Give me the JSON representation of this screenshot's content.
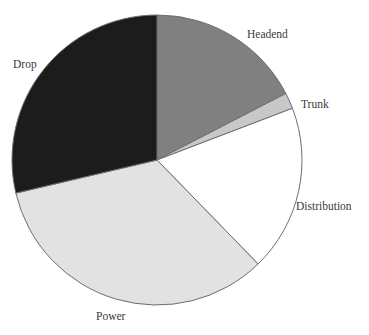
{
  "chart_data": {
    "type": "pie",
    "title": "",
    "subtitle": "",
    "xlabel": "",
    "ylabel": "",
    "legend_position": "none",
    "grid": false,
    "labels_outside": true,
    "start_angle_deg": 0,
    "direction": "clockwise",
    "categories": [
      "Headend",
      "Trunk",
      "Distribution",
      "Power",
      "Drop"
    ],
    "values": [
      17.4,
      1.8,
      18.5,
      33.6,
      28.7
    ],
    "units": "percent",
    "slices": [
      {
        "label": "Headend",
        "value": 17.4,
        "start_angle_deg": 0.0,
        "end_angle_deg": 62.7,
        "color": "#808080"
      },
      {
        "label": "Trunk",
        "value": 1.8,
        "start_angle_deg": 62.7,
        "end_angle_deg": 69.1,
        "color": "#c8c8c8"
      },
      {
        "label": "Distribution",
        "value": 18.5,
        "start_angle_deg": 69.1,
        "end_angle_deg": 135.8,
        "color": "#ffffff"
      },
      {
        "label": "Power",
        "value": 33.6,
        "start_angle_deg": 135.8,
        "end_angle_deg": 256.8,
        "color": "#e2e2e2"
      },
      {
        "label": "Drop",
        "value": 28.7,
        "start_angle_deg": 256.8,
        "end_angle_deg": 360.0,
        "color": "#1c1c1c"
      }
    ],
    "geometry": {
      "center_x": 157,
      "center_y": 160,
      "radius": 145
    },
    "style": {
      "outline_color": "#6e6e6e",
      "outline_width": 1,
      "label_color": "#3a3a3a",
      "background": "#ffffff"
    }
  }
}
